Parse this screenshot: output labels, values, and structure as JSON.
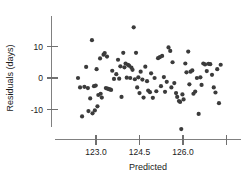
{
  "chart_data": {
    "type": "scatter",
    "title": "",
    "xlabel": "Predicted",
    "ylabel": "Residuals (days)",
    "xlim": [
      122.3,
      127.8
    ],
    "ylim": [
      -17.5,
      18.0
    ],
    "grid": false,
    "legend": null,
    "xticks": [
      123.0,
      124.5,
      126.0,
      127.5
    ],
    "xticklabels": [
      "123.0",
      "124.5",
      "126.0",
      ""
    ],
    "yticks": [
      10,
      0,
      -10
    ],
    "yticklabels": [
      "10",
      "0",
      "-10"
    ],
    "marker": {
      "shape": "circle",
      "size": 2.1,
      "color": "#3b3b3b"
    },
    "points": [
      {
        "x": 122.38,
        "y": 0.0
      },
      {
        "x": 122.45,
        "y": -3.0
      },
      {
        "x": 122.52,
        "y": -12.2
      },
      {
        "x": 122.6,
        "y": -2.8
      },
      {
        "x": 122.66,
        "y": 3.5
      },
      {
        "x": 122.72,
        "y": -3.2
      },
      {
        "x": 122.74,
        "y": -10.5
      },
      {
        "x": 122.8,
        "y": -6.5
      },
      {
        "x": 122.86,
        "y": 12.0
      },
      {
        "x": 122.88,
        "y": -11.2
      },
      {
        "x": 122.93,
        "y": -2.6
      },
      {
        "x": 122.96,
        "y": -10.3
      },
      {
        "x": 122.99,
        "y": -2.4
      },
      {
        "x": 123.02,
        "y": 2.8
      },
      {
        "x": 123.05,
        "y": -9.0
      },
      {
        "x": 123.08,
        "y": -5.4
      },
      {
        "x": 123.14,
        "y": 6.2
      },
      {
        "x": 123.16,
        "y": -5.0
      },
      {
        "x": 123.2,
        "y": -6.2
      },
      {
        "x": 123.26,
        "y": 7.4
      },
      {
        "x": 123.3,
        "y": 7.9
      },
      {
        "x": 123.34,
        "y": -3.2
      },
      {
        "x": 123.38,
        "y": 6.8
      },
      {
        "x": 123.4,
        "y": -3.4
      },
      {
        "x": 123.44,
        "y": -3.5
      },
      {
        "x": 123.48,
        "y": -3.6
      },
      {
        "x": 123.52,
        "y": -3.8
      },
      {
        "x": 123.56,
        "y": 2.3
      },
      {
        "x": 123.62,
        "y": -0.3
      },
      {
        "x": 123.7,
        "y": 1.2
      },
      {
        "x": 123.76,
        "y": 5.8
      },
      {
        "x": 123.8,
        "y": -0.2
      },
      {
        "x": 123.84,
        "y": 3.7
      },
      {
        "x": 123.88,
        "y": -6.0
      },
      {
        "x": 123.94,
        "y": 8.0
      },
      {
        "x": 123.98,
        "y": 3.4
      },
      {
        "x": 124.02,
        "y": 4.6
      },
      {
        "x": 124.06,
        "y": 0.1
      },
      {
        "x": 124.1,
        "y": 4.2
      },
      {
        "x": 124.14,
        "y": 3.9
      },
      {
        "x": 124.18,
        "y": 0.0
      },
      {
        "x": 124.22,
        "y": 3.3
      },
      {
        "x": 124.26,
        "y": 2.6
      },
      {
        "x": 124.3,
        "y": 16.1
      },
      {
        "x": 124.34,
        "y": -0.4
      },
      {
        "x": 124.38,
        "y": 8.0
      },
      {
        "x": 124.42,
        "y": -3.0
      },
      {
        "x": 124.46,
        "y": 0.2
      },
      {
        "x": 124.5,
        "y": -4.8
      },
      {
        "x": 124.54,
        "y": 2.0
      },
      {
        "x": 124.6,
        "y": -0.5
      },
      {
        "x": 124.64,
        "y": -6.2
      },
      {
        "x": 124.7,
        "y": 3.6
      },
      {
        "x": 124.76,
        "y": -1.0
      },
      {
        "x": 124.8,
        "y": -4.0
      },
      {
        "x": 124.86,
        "y": -4.5
      },
      {
        "x": 124.9,
        "y": 1.5
      },
      {
        "x": 124.96,
        "y": -6.3
      },
      {
        "x": 125.02,
        "y": 0.0
      },
      {
        "x": 125.08,
        "y": -4.2
      },
      {
        "x": 125.14,
        "y": 6.3
      },
      {
        "x": 125.2,
        "y": 6.6
      },
      {
        "x": 125.24,
        "y": -2.6
      },
      {
        "x": 125.28,
        "y": 7.0
      },
      {
        "x": 125.34,
        "y": 0.3
      },
      {
        "x": 125.38,
        "y": -4.4
      },
      {
        "x": 125.44,
        "y": -1.2
      },
      {
        "x": 125.5,
        "y": 9.7
      },
      {
        "x": 125.56,
        "y": 8.6
      },
      {
        "x": 125.6,
        "y": -3.0
      },
      {
        "x": 125.64,
        "y": 5.0
      },
      {
        "x": 125.7,
        "y": -1.6
      },
      {
        "x": 125.76,
        "y": -4.8
      },
      {
        "x": 125.8,
        "y": -6.0
      },
      {
        "x": 125.86,
        "y": -7.3
      },
      {
        "x": 125.9,
        "y": -7.6
      },
      {
        "x": 125.94,
        "y": -16.2
      },
      {
        "x": 125.98,
        "y": -5.2
      },
      {
        "x": 126.02,
        "y": -6.8
      },
      {
        "x": 126.08,
        "y": 4.6
      },
      {
        "x": 126.12,
        "y": 1.8
      },
      {
        "x": 126.18,
        "y": 8.4
      },
      {
        "x": 126.22,
        "y": -2.0
      },
      {
        "x": 126.26,
        "y": 2.0
      },
      {
        "x": 126.32,
        "y": 2.4
      },
      {
        "x": 126.36,
        "y": -5.0
      },
      {
        "x": 126.42,
        "y": -4.3
      },
      {
        "x": 126.48,
        "y": 0.0
      },
      {
        "x": 126.54,
        "y": -11.4
      },
      {
        "x": 126.6,
        "y": 0.2
      },
      {
        "x": 126.64,
        "y": -2.2
      },
      {
        "x": 126.7,
        "y": 4.6
      },
      {
        "x": 126.76,
        "y": 4.3
      },
      {
        "x": 126.82,
        "y": 2.2
      },
      {
        "x": 126.88,
        "y": 4.5
      },
      {
        "x": 126.94,
        "y": 4.4
      },
      {
        "x": 127.0,
        "y": 1.0
      },
      {
        "x": 127.06,
        "y": -3.0
      },
      {
        "x": 127.12,
        "y": -4.6
      },
      {
        "x": 127.18,
        "y": 2.8
      },
      {
        "x": 127.24,
        "y": -8.0
      },
      {
        "x": 127.3,
        "y": 4.2
      }
    ]
  },
  "axes": {
    "x_title": "Predicted",
    "y_title": "Residuals (days)"
  }
}
